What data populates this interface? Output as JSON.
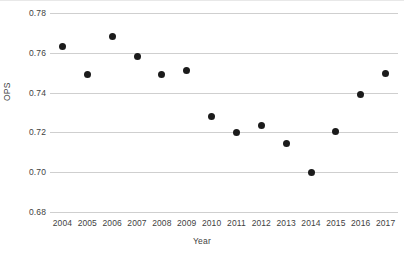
{
  "chart_data": {
    "type": "scatter",
    "title": "",
    "xlabel": "Year",
    "ylabel": "OPS",
    "x": [
      2004,
      2005,
      2006,
      2007,
      2008,
      2009,
      2010,
      2011,
      2012,
      2013,
      2014,
      2015,
      2016,
      2017
    ],
    "values": [
      0.763,
      0.749,
      0.768,
      0.758,
      0.749,
      0.751,
      0.728,
      0.72,
      0.7235,
      0.7145,
      0.7,
      0.7205,
      0.739,
      0.7495
    ],
    "categories": [
      "2004",
      "2005",
      "2006",
      "2007",
      "2008",
      "2009",
      "2010",
      "2011",
      "2012",
      "2013",
      "2014",
      "2015",
      "2016",
      "2017"
    ],
    "xtick_labels": [
      "2004",
      "2005",
      "2006",
      "2007",
      "2008",
      "2009",
      "2010",
      "2011",
      "2012",
      "2013",
      "2014",
      "2015",
      "2016",
      "2017"
    ],
    "ytick_labels": [
      "0.78",
      "0.76",
      "0.74",
      "0.72",
      "0.70",
      "0.68"
    ],
    "ytick_values": [
      0.78,
      0.76,
      0.74,
      0.72,
      0.7,
      0.68
    ],
    "ylim": [
      0.68,
      0.78
    ],
    "xlim": [
      2003.5,
      2017.5
    ],
    "grid": "horizontal",
    "legend": "none",
    "marker_color": "#1b1b1b",
    "gridline_color": "#cfcfcf",
    "background_color": "#ffffff",
    "points": [
      {
        "year": "2004",
        "ops": 0.763
      },
      {
        "year": "2005",
        "ops": 0.749
      },
      {
        "year": "2006",
        "ops": 0.768
      },
      {
        "year": "2007",
        "ops": 0.758
      },
      {
        "year": "2008",
        "ops": 0.749
      },
      {
        "year": "2009",
        "ops": 0.751
      },
      {
        "year": "2010",
        "ops": 0.728
      },
      {
        "year": "2011",
        "ops": 0.72
      },
      {
        "year": "2012",
        "ops": 0.7235
      },
      {
        "year": "2013",
        "ops": 0.7145
      },
      {
        "year": "2014",
        "ops": 0.7
      },
      {
        "year": "2015",
        "ops": 0.7205
      },
      {
        "year": "2016",
        "ops": 0.739
      },
      {
        "year": "2017",
        "ops": 0.7495
      }
    ]
  }
}
